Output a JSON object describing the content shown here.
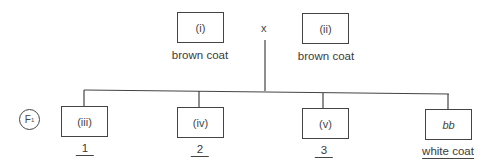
{
  "parents": [
    {
      "id": "(i)",
      "phenotype": "brown coat"
    },
    {
      "id": "(ii)",
      "phenotype": "brown coat"
    }
  ],
  "cross_symbol": "x",
  "generation_label": {
    "main": "F",
    "sub": "1"
  },
  "offspring": [
    {
      "id": "(iii)",
      "answer": "1",
      "italic": false
    },
    {
      "id": "(iv)",
      "answer": "2",
      "italic": false
    },
    {
      "id": "(v)",
      "answer": "3",
      "italic": false
    },
    {
      "id": "bb",
      "answer": "white coat",
      "italic": true
    }
  ]
}
